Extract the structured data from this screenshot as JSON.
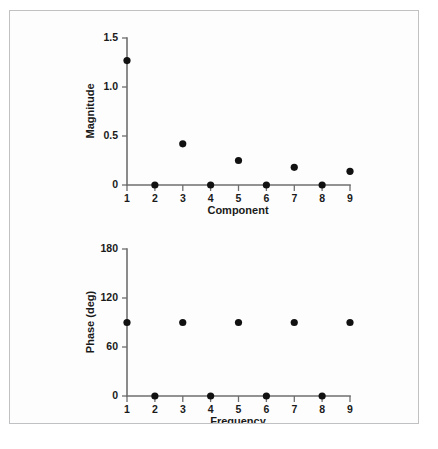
{
  "figure": {
    "background_color": "#fdfdfd",
    "border_color": "#bfc1c3",
    "marker_color": "#111111",
    "axis_color": "#6e6e6e"
  },
  "chart_data": [
    {
      "type": "scatter",
      "title": "",
      "xlabel": "Component",
      "ylabel": "Magnitude",
      "x": [
        1,
        2,
        3,
        4,
        5,
        6,
        7,
        8,
        9
      ],
      "values": [
        1.27,
        0.0,
        0.42,
        0.0,
        0.25,
        0.0,
        0.18,
        0.0,
        0.14
      ],
      "xlim": [
        1,
        9
      ],
      "ylim": [
        0,
        1.5
      ],
      "xticks": [
        1,
        2,
        3,
        4,
        5,
        6,
        7,
        8,
        9
      ],
      "xtick_labels": [
        "1",
        "2",
        "3",
        "4",
        "5",
        "6",
        "7",
        "8",
        "9"
      ],
      "yticks": [
        0,
        0.5,
        1.0,
        1.5
      ],
      "ytick_labels": [
        "0",
        "0.5",
        "1.0",
        "1.5"
      ],
      "grid": false,
      "legend": "none"
    },
    {
      "type": "scatter",
      "title": "",
      "xlabel": "Frequency",
      "ylabel": "Phase (deg)",
      "x": [
        1,
        2,
        3,
        4,
        5,
        6,
        7,
        8,
        9
      ],
      "values": [
        90,
        0,
        90,
        0,
        90,
        0,
        90,
        0,
        90
      ],
      "xlim": [
        1,
        9
      ],
      "ylim": [
        0,
        180
      ],
      "xticks": [
        1,
        2,
        3,
        4,
        5,
        6,
        7,
        8,
        9
      ],
      "xtick_labels": [
        "1",
        "2",
        "3",
        "4",
        "5",
        "6",
        "7",
        "8",
        "9"
      ],
      "yticks": [
        0,
        60,
        120,
        180
      ],
      "ytick_labels": [
        "0",
        "60",
        "120",
        "180"
      ],
      "grid": false,
      "legend": "none"
    }
  ]
}
